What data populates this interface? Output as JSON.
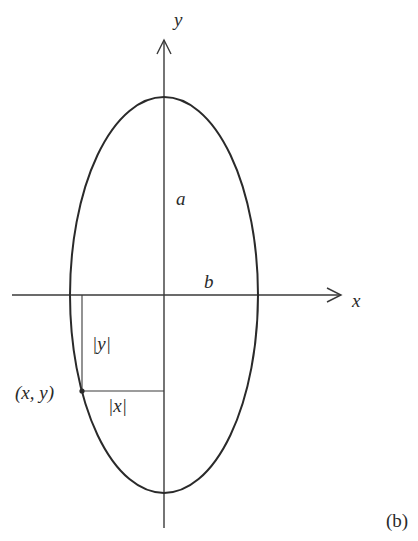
{
  "diagram": {
    "type": "ellipse-coordinate-figure",
    "panel_label": "(b)",
    "axes": {
      "x_label": "x",
      "y_label": "y"
    },
    "ellipse": {
      "semi_major_label": "a",
      "semi_minor_label": "b",
      "orientation": "vertical major axis"
    },
    "point": {
      "label": "(x, y)",
      "abs_y_label": "|y|",
      "abs_x_label": "|x|"
    },
    "colors": {
      "stroke": "#2a2a2a",
      "background": "#ffffff"
    }
  }
}
